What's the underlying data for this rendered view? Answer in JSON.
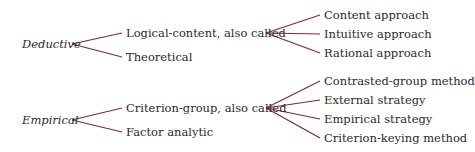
{
  "diagram": {
    "line_color": "#7a2a3a",
    "trees": [
      {
        "root": "Deductive",
        "children": [
          {
            "label": "Logical-content, also called",
            "children": [
              "Content approach",
              "Intuitive approach",
              "Rational approach"
            ]
          },
          {
            "label": "Theoretical",
            "children": []
          }
        ]
      },
      {
        "root": "Empirical",
        "children": [
          {
            "label": "Criterion-group, also called",
            "children": [
              "Contrasted-group method",
              "External strategy",
              "Empirical strategy",
              "Criterion-keying method"
            ]
          },
          {
            "label": "Factor analytic",
            "children": []
          }
        ]
      }
    ]
  }
}
